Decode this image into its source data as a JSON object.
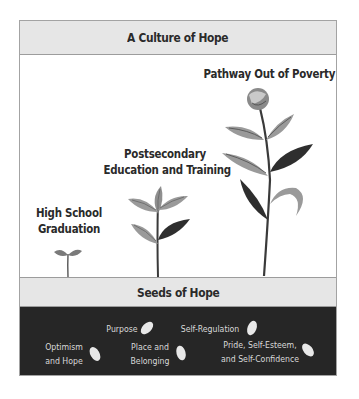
{
  "header": {
    "title": "A Culture of Hope"
  },
  "stages": [
    {
      "id": "high-school",
      "lines": [
        "High School",
        "Graduation"
      ]
    },
    {
      "id": "postsecondary",
      "lines": [
        "Postsecondary",
        "Education and Training"
      ]
    },
    {
      "id": "pathway",
      "lines": [
        "Pathway Out of Poverty"
      ]
    }
  ],
  "seeds_section": {
    "title": "Seeds of Hope",
    "seeds": [
      {
        "id": "purpose",
        "lines": [
          "Purpose"
        ]
      },
      {
        "id": "self-regulation",
        "lines": [
          "Self-Regulation"
        ]
      },
      {
        "id": "optimism",
        "lines": [
          "Optimism",
          "and Hope"
        ]
      },
      {
        "id": "place",
        "lines": [
          "Place and",
          "Belonging"
        ]
      },
      {
        "id": "pride",
        "lines": [
          "Pride, Self-Esteem,",
          "and Self-Confidence"
        ]
      }
    ]
  },
  "colors": {
    "band": "#e6e6e6",
    "dark_area": "#262626",
    "leaf_light": "#9a9a9a",
    "leaf_dark": "#2e2e2e",
    "stem": "#3a3a3a",
    "seed": "#e8e8e8"
  }
}
